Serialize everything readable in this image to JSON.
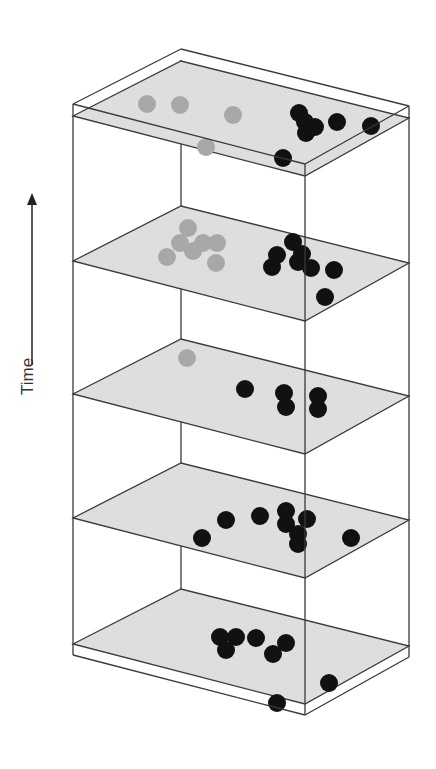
{
  "figure": {
    "axis_label": "Time",
    "axis_direction": "up",
    "colors": {
      "edge": "#3a3a3a",
      "plane_fill": "#dedede",
      "dot_active": "#111111",
      "dot_inactive": "#a8a8a8",
      "label": "#333333"
    },
    "dot_radius": 9,
    "layers": [
      {
        "name": "layer-5-top",
        "plane_y": 116,
        "gray_dots": [
          [
            147,
            104
          ],
          [
            180,
            105
          ],
          [
            233,
            115
          ],
          [
            206,
            147
          ]
        ],
        "black_dots": [
          [
            299,
            113
          ],
          [
            305,
            122
          ],
          [
            315,
            127
          ],
          [
            306,
            133
          ],
          [
            337,
            122
          ],
          [
            371,
            126
          ],
          [
            283,
            158
          ]
        ]
      },
      {
        "name": "layer-4",
        "plane_y": 261,
        "gray_dots": [
          [
            188,
            228
          ],
          [
            180,
            243
          ],
          [
            193,
            251
          ],
          [
            203,
            243
          ],
          [
            217,
            243
          ],
          [
            167,
            257
          ],
          [
            216,
            263
          ]
        ],
        "black_dots": [
          [
            293,
            242
          ],
          [
            277,
            255
          ],
          [
            272,
            267
          ],
          [
            302,
            254
          ],
          [
            298,
            262
          ],
          [
            311,
            268
          ],
          [
            334,
            270
          ],
          [
            325,
            297
          ]
        ]
      },
      {
        "name": "layer-3",
        "plane_y": 394,
        "gray_dots": [
          [
            187,
            358
          ]
        ],
        "black_dots": [
          [
            245,
            389
          ],
          [
            284,
            393
          ],
          [
            286,
            407
          ],
          [
            318,
            396
          ],
          [
            318,
            409
          ]
        ]
      },
      {
        "name": "layer-2",
        "plane_y": 518,
        "gray_dots": [],
        "black_dots": [
          [
            202,
            538
          ],
          [
            226,
            520
          ],
          [
            260,
            516
          ],
          [
            286,
            511
          ],
          [
            286,
            524
          ],
          [
            307,
            519
          ],
          [
            298,
            534
          ],
          [
            298,
            544
          ],
          [
            351,
            538
          ]
        ]
      },
      {
        "name": "layer-1-bottom",
        "plane_y": 644,
        "gray_dots": [],
        "black_dots": [
          [
            220,
            637
          ],
          [
            236,
            637
          ],
          [
            226,
            650
          ],
          [
            256,
            638
          ],
          [
            286,
            643
          ],
          [
            273,
            654
          ],
          [
            329,
            683
          ],
          [
            277,
            703
          ]
        ]
      }
    ]
  }
}
